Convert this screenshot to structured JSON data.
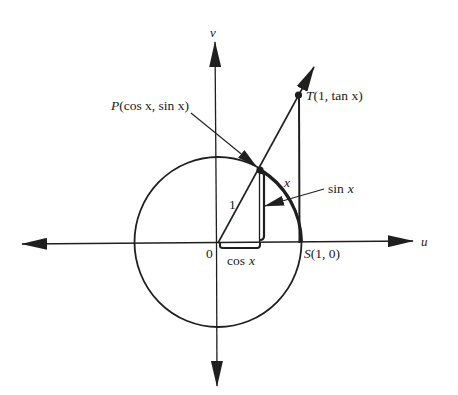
{
  "figure": {
    "type": "unit-circle-trig-diagram",
    "colors": {
      "stroke": "#1f1f1f",
      "background": "#ffffff"
    },
    "axes": {
      "horizontal_label": "u",
      "vertical_label": "v"
    },
    "labels": {
      "origin": "0",
      "radius": "1",
      "arc": "x",
      "point_P": {
        "letter": "P",
        "coords": "(cos x, sin x)"
      },
      "point_T": {
        "letter": "T",
        "coords": "(1, tan x)"
      },
      "point_S": {
        "letter": "S",
        "coords": "(1, 0)"
      },
      "sin_label": {
        "fn": "sin",
        "var": "x"
      },
      "cos_label": {
        "fn": "cos",
        "var": "x"
      }
    },
    "geometry": {
      "origin": [
        218,
        243
      ],
      "radius": 84,
      "angle_deg": 60,
      "P": [
        260,
        170
      ],
      "T": [
        299,
        96
      ],
      "S": [
        302,
        242
      ]
    }
  }
}
